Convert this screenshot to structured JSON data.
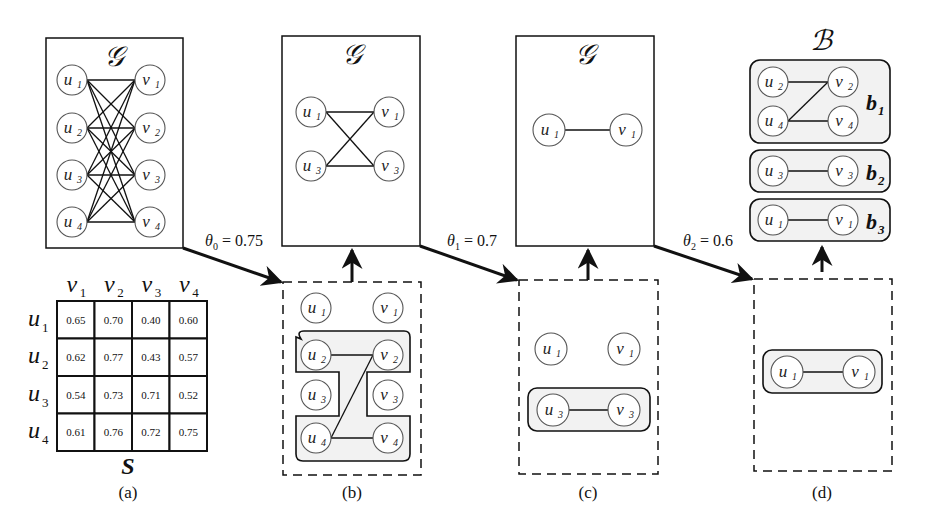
{
  "figure": {
    "panels": {
      "a": {
        "caption": "(a)",
        "graph_title": "𝒢",
        "graph": {
          "left_nodes": [
            "u1",
            "u2",
            "u3",
            "u4"
          ],
          "right_nodes": [
            "v1",
            "v2",
            "v3",
            "v4"
          ],
          "edges": "complete bipartite (all 16 u-v pairs)"
        },
        "matrix": {
          "label": "S",
          "col_headers": [
            {
              "base": "v",
              "sub": "1"
            },
            {
              "base": "v",
              "sub": "2"
            },
            {
              "base": "v",
              "sub": "3"
            },
            {
              "base": "v",
              "sub": "4"
            }
          ],
          "row_headers": [
            {
              "base": "u",
              "sub": "1"
            },
            {
              "base": "u",
              "sub": "2"
            },
            {
              "base": "u",
              "sub": "3"
            },
            {
              "base": "u",
              "sub": "4"
            }
          ],
          "rows": [
            [
              "0.65",
              "0.70",
              "0.40",
              "0.60"
            ],
            [
              "0.62",
              "0.77",
              "0.43",
              "0.57"
            ],
            [
              "0.54",
              "0.73",
              "0.71",
              "0.52"
            ],
            [
              "0.61",
              "0.76",
              "0.72",
              "0.75"
            ]
          ]
        }
      },
      "b": {
        "caption": "(b)",
        "graph_title": "𝒢",
        "graph": {
          "nodes": [
            "u1",
            "v1",
            "u3",
            "v3"
          ],
          "edges": [
            [
              "u1",
              "v1"
            ],
            [
              "u1",
              "v3"
            ],
            [
              "u3",
              "v1"
            ],
            [
              "u3",
              "v3"
            ]
          ]
        },
        "threshold_graph": {
          "isolated": [
            "u1",
            "v1",
            "u3",
            "v3"
          ],
          "group_nodes": [
            "u2",
            "v2",
            "u4",
            "v4"
          ],
          "edges": [
            [
              "u2",
              "v2"
            ],
            [
              "u4",
              "v2"
            ],
            [
              "u4",
              "v4"
            ]
          ]
        }
      },
      "c": {
        "caption": "(c)",
        "graph_title": "𝒢",
        "graph": {
          "nodes": [
            "u1",
            "v1"
          ],
          "edges": [
            [
              "u1",
              "v1"
            ]
          ]
        },
        "threshold_graph": {
          "isolated": [
            "u1",
            "v1"
          ],
          "group_nodes": [
            "u3",
            "v3"
          ],
          "edges": [
            [
              "u3",
              "v3"
            ]
          ]
        }
      },
      "d": {
        "caption": "(d)",
        "result_title": "ℬ",
        "bicliques": [
          {
            "label": "b",
            "sub": "1",
            "nodes": [
              "u2",
              "v2",
              "u4",
              "v4"
            ],
            "edges": [
              [
                "u2",
                "v2"
              ],
              [
                "u4",
                "v2"
              ],
              [
                "u4",
                "v4"
              ]
            ]
          },
          {
            "label": "b",
            "sub": "2",
            "nodes": [
              "u3",
              "v3"
            ],
            "edges": [
              [
                "u3",
                "v3"
              ]
            ]
          },
          {
            "label": "b",
            "sub": "3",
            "nodes": [
              "u1",
              "v1"
            ],
            "edges": [
              [
                "u1",
                "v1"
              ]
            ]
          }
        ],
        "threshold_graph": {
          "group_nodes": [
            "u1",
            "v1"
          ],
          "edges": [
            [
              "u1",
              "v1"
            ]
          ]
        }
      }
    },
    "thresholds": [
      {
        "symbol": "θ",
        "sub": "0",
        "text": " = 0.75"
      },
      {
        "symbol": "θ",
        "sub": "1",
        "text": " = 0.7"
      },
      {
        "symbol": "θ",
        "sub": "2",
        "text": " = 0.6"
      }
    ],
    "node_letters": {
      "u": "u",
      "v": "v"
    },
    "colors": {
      "stroke": "#111111",
      "node_stroke": "#555555",
      "group_fill": "#f2f2f2",
      "background": "#ffffff"
    }
  }
}
